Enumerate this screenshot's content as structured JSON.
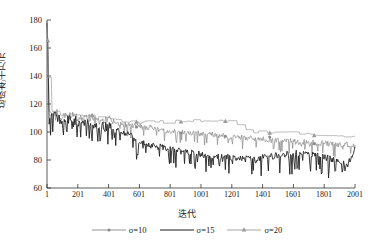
{
  "chart_data": {
    "type": "line",
    "title": "",
    "xlabel": "迭代",
    "ylabel": "总成本/十万元",
    "xlim": [
      1,
      2001
    ],
    "ylim": [
      60,
      180
    ],
    "grid": false,
    "legend_position": "below-axes",
    "yticks": [
      60,
      80,
      100,
      120,
      140,
      160,
      180
    ],
    "xticks": [
      1,
      201,
      401,
      601,
      801,
      1001,
      1201,
      1401,
      1601,
      1801,
      2001
    ],
    "series": [
      {
        "name": "σ=10",
        "label": "σ=10",
        "color": "#8a8a8a",
        "marker": "dot",
        "x": [
          1,
          15,
          30,
          60,
          100,
          150,
          201,
          260,
          320,
          401,
          470,
          540,
          601,
          680,
          760,
          801,
          880,
          950,
          1001,
          1080,
          1150,
          1201,
          1280,
          1350,
          1401,
          1480,
          1550,
          1601,
          1680,
          1760,
          1801,
          1880,
          1950,
          2001
        ],
        "y": [
          180,
          116,
          112,
          114,
          110,
          112,
          110,
          111,
          108,
          109,
          106,
          105,
          104,
          103,
          101,
          100,
          100,
          99,
          99,
          98,
          97,
          96,
          96,
          95,
          95,
          94,
          94,
          93,
          93,
          92,
          92,
          91,
          91,
          90
        ]
      },
      {
        "name": "σ=15",
        "label": "σ=15",
        "color": "#1a1a1a",
        "marker": "none",
        "x": [
          1,
          15,
          30,
          60,
          100,
          150,
          201,
          260,
          320,
          401,
          470,
          540,
          601,
          680,
          760,
          801,
          880,
          950,
          1001,
          1080,
          1150,
          1201,
          1280,
          1350,
          1401,
          1480,
          1550,
          1601,
          1680,
          1760,
          1801,
          1880,
          1950,
          2001
        ],
        "y": [
          178,
          113,
          110,
          112,
          108,
          110,
          107,
          106,
          104,
          104,
          100,
          98,
          93,
          90,
          89,
          88,
          86,
          85,
          84,
          83,
          82,
          82,
          81,
          80,
          82,
          83,
          84,
          85,
          84,
          83,
          82,
          80,
          76,
          88
        ]
      },
      {
        "name": "σ=20",
        "label": "σ=20",
        "color": "#9a9a9a",
        "marker": "triangle",
        "x": [
          1,
          15,
          30,
          60,
          100,
          150,
          201,
          260,
          320,
          401,
          470,
          540,
          601,
          680,
          760,
          801,
          880,
          950,
          1001,
          1080,
          1150,
          1201,
          1280,
          1350,
          1401,
          1480,
          1550,
          1601,
          1680,
          1760,
          1801,
          1880,
          1950,
          2001
        ],
        "y": [
          180,
          118,
          114,
          115,
          112,
          113,
          111,
          112,
          110,
          110,
          108,
          107,
          106,
          107,
          107,
          107,
          107,
          108,
          108,
          108,
          108,
          108,
          101,
          100,
          100,
          100,
          99,
          99,
          98,
          98,
          98,
          97,
          97,
          97
        ]
      }
    ]
  },
  "axes": {
    "ylabel": "总成本/十万元",
    "xlabel": "迭代"
  },
  "yticklabels": [
    "180",
    "160",
    "140",
    "120",
    "100",
    "80",
    "60"
  ],
  "xticklabels": [
    "1",
    "201",
    "401",
    "601",
    "801",
    "1001",
    "1201",
    "1401",
    "1601",
    "1801",
    "2001"
  ],
  "legend": {
    "items": [
      {
        "label": "σ=10",
        "symbol": "dot",
        "color": "#8a8a8a"
      },
      {
        "label": "σ=15",
        "symbol": "line",
        "color": "#1a1a1a"
      },
      {
        "label": "σ=20",
        "symbol": "triangle",
        "color": "#9a9a9a"
      }
    ]
  }
}
